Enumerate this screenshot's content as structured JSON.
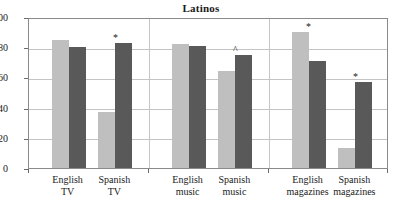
{
  "chart_data": {
    "type": "bar",
    "title": "Latinos",
    "xlabel": "",
    "ylabel": "",
    "ylim": [
      0,
      100
    ],
    "yticks": [
      0,
      20,
      40,
      60,
      80,
      100
    ],
    "grid": true,
    "legend": "none",
    "categories": [
      "English TV",
      "Spanish TV",
      "English music",
      "Spanish music",
      "English magazines",
      "Spanish magazines"
    ],
    "category_lines": [
      [
        "English",
        "TV"
      ],
      [
        "Spanish",
        "TV"
      ],
      [
        "English",
        "music"
      ],
      [
        "Spanish",
        "music"
      ],
      [
        "English",
        "magazines"
      ],
      [
        "Spanish",
        "magazines"
      ]
    ],
    "series": [
      {
        "name": "light-gray-series",
        "color": "#bfbfbf",
        "values": [
          85,
          37,
          82,
          64,
          90,
          13
        ]
      },
      {
        "name": "dark-gray-series",
        "color": "#595959",
        "values": [
          80,
          83,
          81,
          75,
          71,
          57
        ]
      }
    ],
    "annotations": [
      {
        "category": "Spanish TV",
        "symbol": "*"
      },
      {
        "category": "Spanish music",
        "symbol": "^"
      },
      {
        "category": "English magazines",
        "symbol": "*"
      },
      {
        "category": "Spanish magazines",
        "symbol": "*"
      }
    ],
    "panel_separators": 2
  },
  "axis": {
    "y_tick_labels": [
      "100",
      "80",
      "60",
      "40",
      "20",
      "0"
    ]
  }
}
